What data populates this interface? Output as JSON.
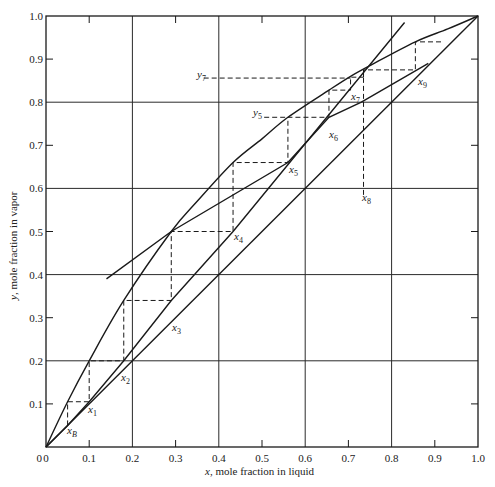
{
  "chart_data": {
    "type": "line",
    "title": "",
    "xlabel": "x, mole fraction in liquid",
    "ylabel": "y, mole fraction in vapor",
    "xlim": [
      0,
      1.0
    ],
    "ylim": [
      0,
      1.0
    ],
    "grid": true,
    "x_ticks": [
      "0",
      "0.1",
      "0.2",
      "0.3",
      "0.4",
      "0.5",
      "0.6",
      "0.7",
      "0.8",
      "0.9",
      "1.0"
    ],
    "y_ticks": [
      "0",
      "0.1",
      "0.2",
      "0.3",
      "0.4",
      "0.5",
      "0.6",
      "0.7",
      "0.8",
      "0.9",
      "1.0"
    ],
    "series": [
      {
        "name": "diagonal (y = x)",
        "style": "solid",
        "points": [
          [
            0,
            0
          ],
          [
            1.0,
            1.0
          ]
        ]
      },
      {
        "name": "equilibrium curve",
        "style": "solid",
        "points": [
          [
            0,
            0
          ],
          [
            0.05,
            0.105
          ],
          [
            0.1,
            0.2
          ],
          [
            0.18,
            0.34
          ],
          [
            0.29,
            0.5
          ],
          [
            0.35,
            0.57
          ],
          [
            0.433,
            0.66
          ],
          [
            0.5,
            0.715
          ],
          [
            0.56,
            0.765
          ],
          [
            0.655,
            0.828
          ],
          [
            0.705,
            0.86
          ],
          [
            0.75,
            0.885
          ],
          [
            0.855,
            0.94
          ],
          [
            0.93,
            0.97
          ],
          [
            1.0,
            1.0
          ]
        ]
      },
      {
        "name": "stripping operating line",
        "style": "solid",
        "points": [
          [
            0,
            0
          ],
          [
            0.05,
            0.05
          ],
          [
            0.1,
            0.105
          ],
          [
            0.18,
            0.2
          ],
          [
            0.29,
            0.34
          ],
          [
            0.433,
            0.5
          ],
          [
            0.83,
            0.985
          ]
        ]
      },
      {
        "name": "rectifying operating line",
        "style": "solid",
        "points": [
          [
            0.14,
            0.39
          ],
          [
            0.29,
            0.5
          ],
          [
            0.56,
            0.66
          ],
          [
            0.655,
            0.765
          ],
          [
            0.73,
            0.8
          ],
          [
            0.885,
            0.89
          ]
        ]
      },
      {
        "name": "stage steps",
        "style": "dashed",
        "points": [
          [
            0.05,
            0.05
          ],
          [
            0.05,
            0.105
          ],
          [
            0.1,
            0.105
          ],
          [
            0.1,
            0.2
          ],
          [
            0.18,
            0.2
          ],
          [
            0.18,
            0.34
          ],
          [
            0.29,
            0.34
          ],
          [
            0.29,
            0.5
          ],
          [
            0.433,
            0.5
          ],
          [
            0.433,
            0.66
          ],
          [
            0.56,
            0.66
          ],
          [
            0.56,
            0.765
          ],
          [
            0.655,
            0.765
          ],
          [
            0.655,
            0.828
          ],
          [
            0.705,
            0.828
          ],
          [
            0.705,
            0.858
          ],
          [
            0.735,
            0.858
          ],
          [
            0.735,
            0.875
          ],
          [
            0.855,
            0.875
          ],
          [
            0.855,
            0.94
          ],
          [
            0.92,
            0.94
          ]
        ]
      }
    ],
    "annotations": [
      {
        "text": "x_B",
        "x": 0.05,
        "y": 0.05
      },
      {
        "text": "x_1",
        "x": 0.1,
        "y": 0.105
      },
      {
        "text": "x_2",
        "x": 0.18,
        "y": 0.2
      },
      {
        "text": "x_3",
        "x": 0.29,
        "y": 0.34
      },
      {
        "text": "x_4",
        "x": 0.433,
        "y": 0.5
      },
      {
        "text": "x_5",
        "x": 0.56,
        "y": 0.66
      },
      {
        "text": "y_5",
        "x": 0.56,
        "y": 0.765
      },
      {
        "text": "x_6",
        "x": 0.655,
        "y": 0.765
      },
      {
        "text": "x_7",
        "x": 0.705,
        "y": 0.828
      },
      {
        "text": "y_7",
        "x": 0.36,
        "y": 0.856
      },
      {
        "text": "x_8",
        "x": 0.735,
        "y": 0.58
      },
      {
        "text": "x_9",
        "x": 0.855,
        "y": 0.875
      }
    ]
  },
  "labels": {
    "xlabel_var": "x",
    "xlabel_rest": ", mole fraction in liquid",
    "ylabel_var": "y",
    "ylabel_rest": ", mole fraction in vapor",
    "pts": {
      "xB": {
        "base": "x",
        "sub": "B"
      },
      "x1": {
        "base": "x",
        "sub": "1"
      },
      "x2": {
        "base": "x",
        "sub": "2"
      },
      "x3": {
        "base": "x",
        "sub": "3"
      },
      "x4": {
        "base": "x",
        "sub": "4"
      },
      "x5": {
        "base": "x",
        "sub": "5"
      },
      "x6": {
        "base": "x",
        "sub": "6"
      },
      "x7": {
        "base": "x",
        "sub": "7"
      },
      "x8": {
        "base": "x",
        "sub": "8"
      },
      "x9": {
        "base": "x",
        "sub": "9"
      },
      "y5": {
        "base": "y",
        "sub": "5"
      },
      "y7": {
        "base": "y",
        "sub": "7"
      }
    }
  },
  "style": {
    "line_color": "#1a1a1a",
    "grid_color": "#2a2a2a",
    "background": "#ffffff"
  }
}
